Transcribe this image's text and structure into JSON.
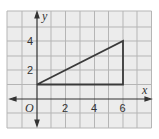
{
  "diagram": {
    "type": "coordinate-grid",
    "axes": {
      "x_label": "x",
      "y_label": "y",
      "origin_label": "O"
    },
    "x_ticks": [
      "2",
      "4",
      "6"
    ],
    "y_ticks": [
      "2",
      "4"
    ],
    "shape": {
      "type": "triangle",
      "vertices": [
        [
          0,
          1
        ],
        [
          6,
          4
        ],
        [
          6,
          1
        ]
      ]
    },
    "colors": {
      "grid": "#b5b5b5",
      "background": "#ececec",
      "axis": "#333333",
      "shape": "#3a3a3a"
    }
  }
}
